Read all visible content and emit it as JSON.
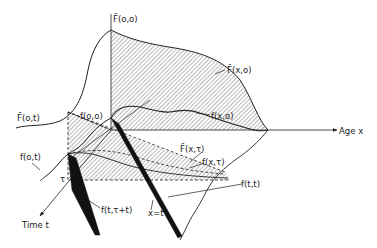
{
  "diagram": {
    "axes": {
      "age_label": "Age x",
      "time_label": "Time t",
      "tau_label": "τ",
      "x_eq_t_label": "x=t"
    },
    "labels": {
      "F_bar_oo": "F̄(o,o)",
      "F_bar_xo": "F̄(x,o)",
      "F_bar_ot": "F̄(o,t)",
      "f_oo": "f(o,o)",
      "f_xo": "f(x,o)",
      "F_bar_xtau": "F̄(x,τ)",
      "f_xtau": "f(x,τ)",
      "f_ot": "f(o,t)",
      "f_ttau": "f(t,τ+t)",
      "f_tt": "f(t,t)"
    },
    "colors": {
      "ink": "#222222",
      "background": "#ffffff"
    }
  }
}
